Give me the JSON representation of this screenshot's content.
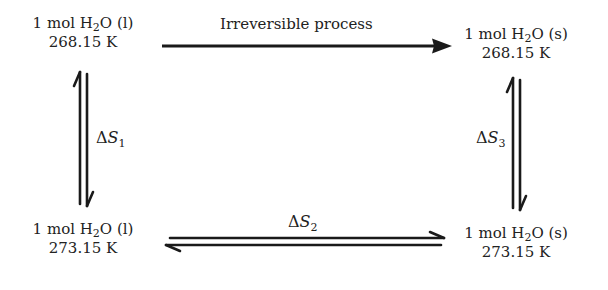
{
  "diagram": {
    "nodes": {
      "top_left": {
        "prefix": "1 mol H",
        "sub": "2",
        "suffix": "O (l)",
        "temp": "268.15 K"
      },
      "top_right": {
        "prefix": "1 mol H",
        "sub": "2",
        "suffix": "O (s)",
        "temp": "268.15 K"
      },
      "bottom_left": {
        "prefix": "1 mol H",
        "sub": "2",
        "suffix": "O (l)",
        "temp": "273.15 K"
      },
      "bottom_right": {
        "prefix": "1 mol H",
        "sub": "2",
        "suffix": "O (s)",
        "temp": "273.15 K"
      }
    },
    "edges": {
      "top": {
        "label": "Irreversible process",
        "from": "top_left",
        "to": "top_right",
        "type": "single-arrow"
      },
      "left": {
        "delta": "Δ",
        "symbol": "S",
        "sub": "1",
        "type": "equilibrium-harpoons"
      },
      "bottom": {
        "delta": "Δ",
        "symbol": "S",
        "sub": "2",
        "type": "equilibrium-harpoons"
      },
      "right": {
        "delta": "Δ",
        "symbol": "S",
        "sub": "3",
        "type": "equilibrium-harpoons"
      }
    },
    "colors": {
      "ink": "#1a1a1a",
      "background": "#ffffff"
    }
  }
}
